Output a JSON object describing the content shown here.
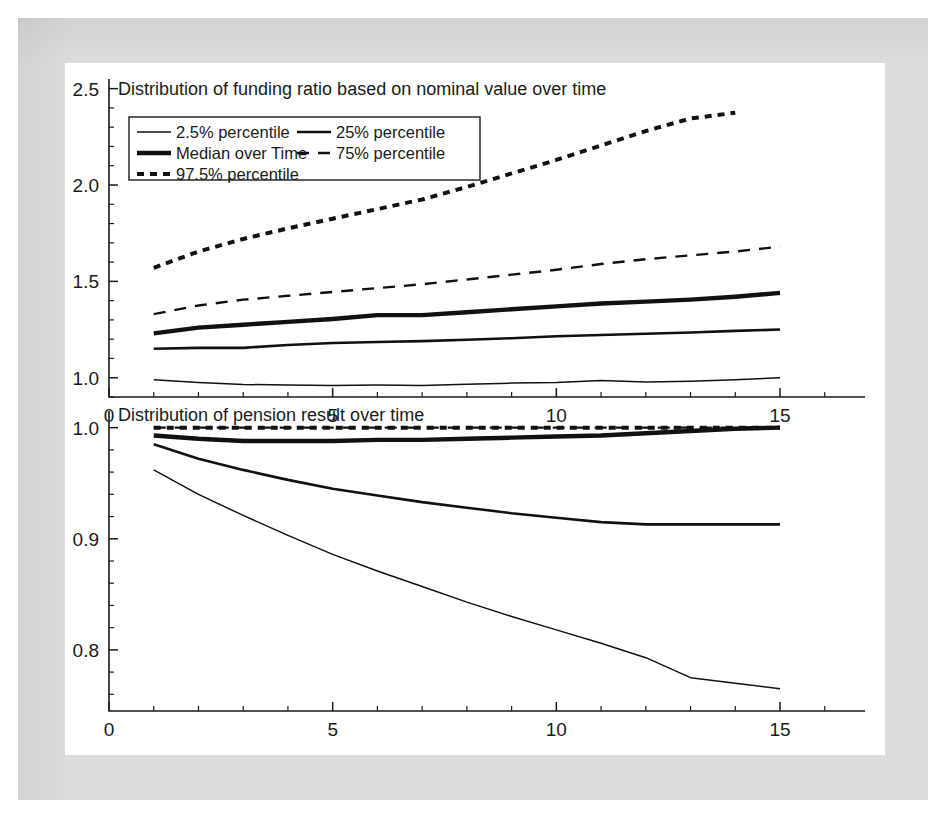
{
  "figure": {
    "background_color": "#ffffff",
    "border_color": "#dcdcdc",
    "line_color": "#111111"
  },
  "legend": {
    "position": "upper-left",
    "entries": [
      {
        "label": "2.5% percentile",
        "style": "thin-solid"
      },
      {
        "label": "25% percentile",
        "style": "medium-solid"
      },
      {
        "label": "Median over Time",
        "style": "thick-solid"
      },
      {
        "label": "75% percentile",
        "style": "long-dashed"
      },
      {
        "label": "97.5% percentile",
        "style": "dotted-thick"
      }
    ]
  },
  "chart_data": [
    {
      "type": "line",
      "panel": "top",
      "title": "Distribution of funding ratio based on nominal value over time",
      "xlabel": "",
      "ylabel": "",
      "xlim": [
        0,
        16.9
      ],
      "ylim": [
        0.9,
        2.55
      ],
      "xticks": [
        0,
        5,
        10,
        15
      ],
      "xtick_labels": [
        "0",
        "5",
        "10",
        "15"
      ],
      "yticks": [
        1.0,
        1.5,
        2.0,
        2.5
      ],
      "ytick_labels": [
        "1.0",
        "1.5",
        "2.0",
        "2.5"
      ],
      "minor_tick_interval_x": 1,
      "minor_tick_interval_y": 0.1,
      "grid": false,
      "x": [
        1,
        2,
        3,
        4,
        5,
        6,
        7,
        8,
        9,
        10,
        11,
        12,
        13,
        14,
        15
      ],
      "series": [
        {
          "name": "2.5% percentile",
          "style": "thin-solid",
          "values": [
            0.99,
            0.975,
            0.965,
            0.962,
            0.96,
            0.962,
            0.96,
            0.966,
            0.972,
            0.975,
            0.985,
            0.978,
            0.982,
            0.99,
            1.0
          ]
        },
        {
          "name": "25% percentile",
          "style": "medium-solid",
          "values": [
            1.15,
            1.155,
            1.155,
            1.17,
            1.18,
            1.185,
            1.19,
            1.197,
            1.205,
            1.215,
            1.222,
            1.228,
            1.235,
            1.243,
            1.25
          ]
        },
        {
          "name": "Median over Time",
          "style": "thick-solid",
          "values": [
            1.23,
            1.26,
            1.275,
            1.29,
            1.305,
            1.325,
            1.325,
            1.34,
            1.355,
            1.37,
            1.385,
            1.395,
            1.405,
            1.42,
            1.44
          ]
        },
        {
          "name": "75% percentile",
          "style": "long-dashed",
          "values": [
            1.33,
            1.375,
            1.405,
            1.425,
            1.445,
            1.465,
            1.485,
            1.51,
            1.535,
            1.56,
            1.59,
            1.615,
            1.635,
            1.655,
            1.68
          ]
        },
        {
          "name": "97.5% percentile",
          "style": "dotted-thick",
          "values": [
            1.57,
            1.655,
            1.72,
            1.775,
            1.825,
            1.875,
            1.925,
            1.99,
            2.06,
            2.13,
            2.205,
            2.28,
            2.345,
            2.375,
            null
          ]
        }
      ]
    },
    {
      "type": "line",
      "panel": "bottom",
      "title": "Distribution of pension result over time",
      "xlabel": "",
      "ylabel": "",
      "xlim": [
        0,
        16.9
      ],
      "ylim": [
        0.745,
        1.015
      ],
      "xticks": [
        0,
        5,
        10,
        15
      ],
      "xtick_labels": [
        "0",
        "5",
        "10",
        "15"
      ],
      "yticks": [
        0.8,
        0.9,
        1.0
      ],
      "ytick_labels": [
        "0.8",
        "0.9",
        "1.0"
      ],
      "minor_tick_interval_x": 1,
      "minor_tick_interval_y": 0.02,
      "grid": false,
      "x": [
        1,
        2,
        3,
        4,
        5,
        6,
        7,
        8,
        9,
        10,
        11,
        12,
        13,
        14,
        15
      ],
      "series": [
        {
          "name": "2.5% percentile",
          "style": "thin-solid",
          "values": [
            0.962,
            0.94,
            0.921,
            0.903,
            0.886,
            0.871,
            0.857,
            0.843,
            0.83,
            0.818,
            0.806,
            0.793,
            0.775,
            0.77,
            0.765
          ]
        },
        {
          "name": "25% percentile",
          "style": "medium-solid",
          "values": [
            0.985,
            0.972,
            0.962,
            0.953,
            0.945,
            0.939,
            0.933,
            0.928,
            0.923,
            0.919,
            0.915,
            0.913,
            0.913,
            0.913,
            0.913
          ]
        },
        {
          "name": "Median over Time",
          "style": "thick-solid",
          "values": [
            0.993,
            0.99,
            0.988,
            0.988,
            0.988,
            0.989,
            0.989,
            0.99,
            0.991,
            0.992,
            0.993,
            0.995,
            0.997,
            0.999,
            1.0
          ]
        },
        {
          "name": "75% percentile",
          "style": "long-dashed",
          "values": [
            1.0,
            1.0,
            1.0,
            1.0,
            1.0,
            1.0,
            1.0,
            1.0,
            1.0,
            1.0,
            1.0,
            1.0,
            1.0,
            1.0,
            1.0
          ]
        },
        {
          "name": "97.5% percentile",
          "style": "dotted-thick",
          "values": [
            1.0,
            1.0,
            1.0,
            1.0,
            1.0,
            1.0,
            1.0,
            1.0,
            1.0,
            1.0,
            1.0,
            1.0,
            1.0,
            1.0,
            1.0
          ]
        }
      ]
    }
  ]
}
